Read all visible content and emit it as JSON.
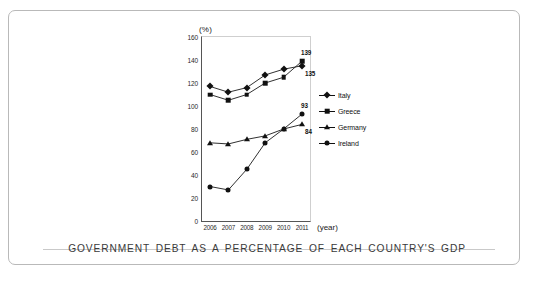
{
  "caption": "GOVERNMENT DEBT AS A PERCENTAGE OF EACH COUNTRY'S GDP",
  "chart_data": {
    "type": "line",
    "title": "",
    "unit_label": "(%)",
    "xlabel": "(year)",
    "ylabel": "",
    "categories": [
      "2006",
      "2007",
      "2008",
      "2009",
      "2010",
      "2011"
    ],
    "x": [
      2006,
      2007,
      2008,
      2009,
      2010,
      2011
    ],
    "ylim": [
      0,
      160
    ],
    "yticks": [
      "0",
      "20",
      "40",
      "60",
      "80",
      "100",
      "120",
      "140",
      "160"
    ],
    "ytick_values": [
      0,
      20,
      40,
      60,
      80,
      100,
      120,
      140,
      160
    ],
    "grid": false,
    "legend_position": "right",
    "series": [
      {
        "name": "Italy",
        "marker": "diamond",
        "values": [
          117,
          112,
          116,
          127,
          132,
          135
        ],
        "end_label": "135"
      },
      {
        "name": "Greece",
        "marker": "square",
        "values": [
          110,
          105,
          110,
          120,
          125,
          139
        ],
        "end_label": "139"
      },
      {
        "name": "Germany",
        "marker": "triangle",
        "values": [
          68,
          67,
          71,
          74,
          80,
          84
        ],
        "end_label": "84"
      },
      {
        "name": "Ireland",
        "marker": "circle",
        "values": [
          30,
          27,
          45,
          68,
          80,
          93
        ],
        "end_label": "93"
      }
    ],
    "annotations": [
      {
        "text": "139",
        "series": "Greece"
      },
      {
        "text": "135",
        "series": "Italy"
      },
      {
        "text": "93",
        "series": "Ireland"
      },
      {
        "text": "84",
        "series": "Germany"
      }
    ]
  }
}
